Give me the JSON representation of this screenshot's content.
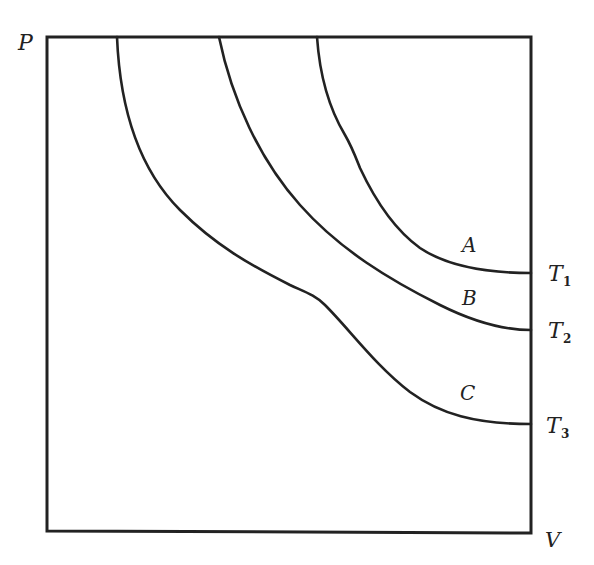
{
  "diagram": {
    "type": "pv-isotherms",
    "axes": {
      "y_label": "P",
      "x_label": "V"
    },
    "curves": [
      {
        "id": "A",
        "label": "A",
        "temperature_label": "T",
        "temperature_sub": "1"
      },
      {
        "id": "B",
        "label": "B",
        "temperature_label": "T",
        "temperature_sub": "2"
      },
      {
        "id": "C",
        "label": "C",
        "temperature_label": "T",
        "temperature_sub": "3"
      }
    ],
    "stroke_color": "#222222",
    "background": "#ffffff"
  }
}
